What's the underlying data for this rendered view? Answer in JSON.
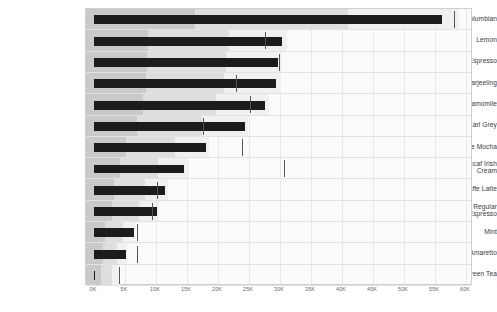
{
  "chart_data": {
    "type": "bar",
    "chart_style": "bullet",
    "title": "",
    "subtitle": "",
    "xlabel": "",
    "ylabel": "",
    "xlim": [
      0,
      60000
    ],
    "grid": true,
    "legend": "none",
    "axis": {
      "tick_values": [
        0,
        5000,
        10000,
        15000,
        20000,
        25000,
        30000,
        35000,
        40000,
        45000,
        50000,
        55000,
        60000
      ],
      "tick_labels": [
        "0K",
        "5K",
        "10K",
        "15K",
        "20K",
        "25K",
        "30K",
        "35K",
        "40K",
        "45K",
        "50K",
        "55K",
        "60K"
      ]
    },
    "categories": [
      "Columbian",
      "Lemon",
      "Decaf Espresso",
      "Darjeeling",
      "Chamomile",
      "Earl Grey",
      "Caffe Mocha",
      "Decaf Irish Cream",
      "Caffe Latte",
      "Regular Espresso",
      "Mint",
      "Amaretto",
      "Green Tea"
    ],
    "series": [
      {
        "name": "Actual",
        "values": [
          56200,
          30400,
          29600,
          29400,
          27500,
          24300,
          18000,
          14500,
          11500,
          10200,
          6400,
          5100,
          200
        ]
      },
      {
        "name": "Target",
        "values": [
          58000,
          27500,
          29800,
          22900,
          25100,
          17600,
          23800,
          30600,
          10200,
          9400,
          6900,
          6900,
          4100
        ]
      }
    ],
    "ranges": [
      {
        "name": "Poor",
        "values": [
          16300,
          8700,
          8500,
          8400,
          7900,
          6900,
          5200,
          4200,
          3300,
          2900,
          1800,
          1500,
          1200
        ]
      },
      {
        "name": "Satisfactory",
        "values": [
          41000,
          21800,
          21300,
          21000,
          19700,
          17400,
          13000,
          10400,
          8300,
          7300,
          4600,
          3700,
          2900
        ]
      },
      {
        "name": "Good",
        "values": [
          58800,
          31200,
          30400,
          30100,
          28200,
          24900,
          18600,
          14900,
          11900,
          10500,
          6600,
          5300,
          4200
        ]
      }
    ]
  },
  "rows": [
    {
      "label_line1": "Columbian",
      "label_line2": ""
    },
    {
      "label_line1": "Lemon",
      "label_line2": ""
    },
    {
      "label_line1": "Decaf Espresso",
      "label_line2": ""
    },
    {
      "label_line1": "Darjeeling",
      "label_line2": ""
    },
    {
      "label_line1": "Chamomile",
      "label_line2": ""
    },
    {
      "label_line1": "Earl Grey",
      "label_line2": ""
    },
    {
      "label_line1": "Caffe Mocha",
      "label_line2": ""
    },
    {
      "label_line1": "Decaf Irish",
      "label_line2": "Cream"
    },
    {
      "label_line1": "Caffe Latte",
      "label_line2": ""
    },
    {
      "label_line1": "Regular",
      "label_line2": "Espresso"
    },
    {
      "label_line1": "Mint",
      "label_line2": ""
    },
    {
      "label_line1": "Amaretto",
      "label_line2": ""
    },
    {
      "label_line1": "Green Tea",
      "label_line2": ""
    }
  ],
  "colors": {
    "measure": "#1c1c1c",
    "target": "#555555",
    "range_poor": "#c9c9c9",
    "range_satisfactory": "#dedede",
    "range_good": "#f0f0f0",
    "plot_background": "#fbfbfb",
    "frame_border": "#cfcfcf",
    "gridline": "#e8e8e8",
    "axis_text": "#666666",
    "label_text": "#3a3a3a"
  }
}
